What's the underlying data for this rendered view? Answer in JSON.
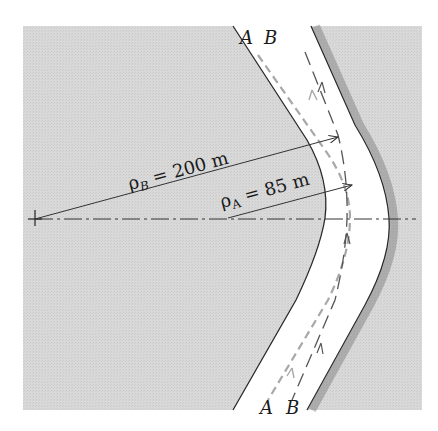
{
  "diagram": {
    "type": "curved road with two paths and radii of curvature",
    "colors": {
      "ground": "#d6d6d6",
      "road": "#ffffff",
      "edge": "#2a2a2a",
      "path_A": "#a8a8a8",
      "path_B": "#555555",
      "lines": "#333333"
    },
    "labels": {
      "top_A": "A",
      "top_B": "B",
      "bottom_A": "A",
      "bottom_B": "B",
      "rho_B": "ρ",
      "rho_B_sub": "B",
      "rho_B_value": " = 200 m",
      "rho_A": "ρ",
      "rho_A_sub": "A",
      "rho_A_value": " = 85 m"
    },
    "paths": [
      {
        "name": "A",
        "radius_m": 85,
        "style": "light gray dashed"
      },
      {
        "name": "B",
        "radius_m": 200,
        "style": "dark long-dashed"
      }
    ],
    "center_line": "dash-dot horizontal axis through centers of curvature"
  }
}
